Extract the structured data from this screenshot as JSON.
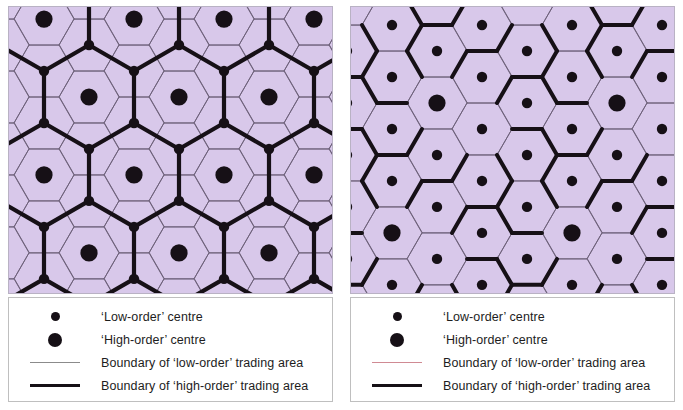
{
  "figure": {
    "background": "#ffffff",
    "map_fill": "#d8c8ea",
    "ink": "#161016"
  },
  "panels": [
    {
      "id": "left",
      "model": "k3-marketing-principle",
      "map": {
        "fill": "#d8c8ea",
        "border_color": "#b9b2c4",
        "low_order_boundary_color": "#6b5f77",
        "low_order_boundary_width": 0.9,
        "high_order_boundary_color": "#161016",
        "high_order_boundary_width": 4.2,
        "hex_radius": 30,
        "orientation": "flat-top",
        "low_order_dot_radius": 5.2,
        "high_order_dot_radius": 8.6,
        "high_order_dot_color": "#161016",
        "low_order_dot_color": "#161016"
      },
      "legend": {
        "border_color": "#bfbfbf",
        "background": "#ffffff",
        "items": [
          {
            "symbol": "dot-small",
            "label": "‘Low-order’ centre"
          },
          {
            "symbol": "dot-large",
            "label": "‘High-order’ centre"
          },
          {
            "symbol": "line-thin",
            "color": "#8b8b8b",
            "label": "Boundary of ‘low-order’ trading area"
          },
          {
            "symbol": "line-thick",
            "color": "#161016",
            "label": "Boundary of ‘high-order’ trading area"
          }
        ]
      }
    },
    {
      "id": "right",
      "model": "k7-administrative-principle",
      "map": {
        "fill": "#d8c8ea",
        "border_color": "#b9b2c4",
        "low_order_boundary_color": "#6b5f77",
        "low_order_boundary_width": 0.9,
        "high_order_boundary_color": "#161016",
        "high_order_boundary_width": 4.0,
        "hex_radius": 30,
        "orientation": "flat-top",
        "low_order_dot_radius": 5.2,
        "high_order_dot_radius": 8.6,
        "high_order_dot_color": "#161016",
        "low_order_dot_color": "#161016"
      },
      "legend": {
        "border_color": "#bfbfbf",
        "background": "#ffffff",
        "items": [
          {
            "symbol": "dot-small",
            "label": "‘Low-order’ centre"
          },
          {
            "symbol": "dot-large",
            "label": "‘High-order’ centre"
          },
          {
            "symbol": "line-thin",
            "color": "#d08a93",
            "label": "Boundary of ‘low-order’ trading area"
          },
          {
            "symbol": "line-thick",
            "color": "#161016",
            "label": "Boundary of ‘high-order’ trading area"
          }
        ]
      }
    }
  ],
  "chart_data": {
    "type": "diagram",
    "series": [
      {
        "name": "left-panel",
        "nesting_factor": 3,
        "low_order_per_high_order": 3
      },
      {
        "name": "right-panel",
        "nesting_factor": 7,
        "low_order_per_high_order": 7
      }
    ]
  }
}
